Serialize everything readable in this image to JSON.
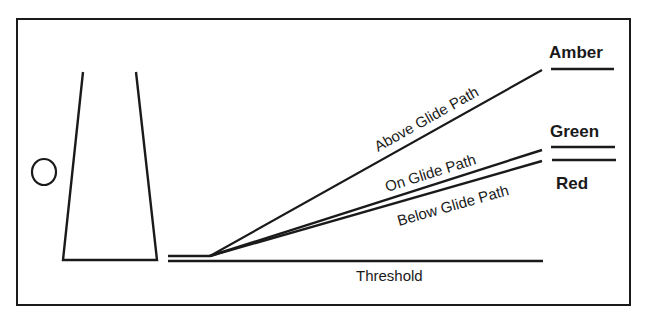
{
  "diagram": {
    "paths": {
      "above": "Above Glide Path",
      "on": "On Glide Path",
      "below": "Below Glide Path"
    },
    "threshold_label": "Threshold",
    "status": {
      "amber": "Amber",
      "green": "Green",
      "red": "Red"
    },
    "colors": {
      "line": "#1a1a1a",
      "background": "#ffffff"
    }
  }
}
